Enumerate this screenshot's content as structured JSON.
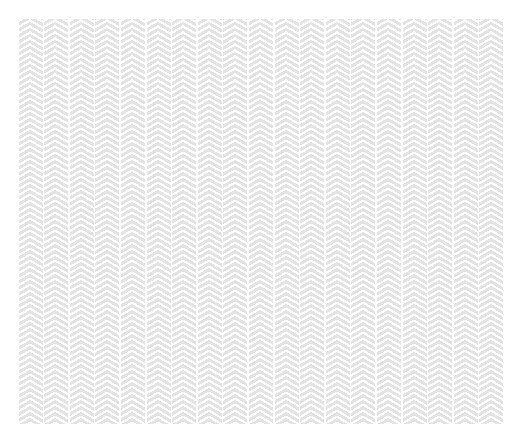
{
  "background": {
    "page_color": "#ffffff",
    "pattern": {
      "type": "herringbone",
      "stripe_color": "#e3e3e3",
      "gap_color": "#ffffff",
      "column_width": 12.8,
      "columns": 38
    }
  }
}
